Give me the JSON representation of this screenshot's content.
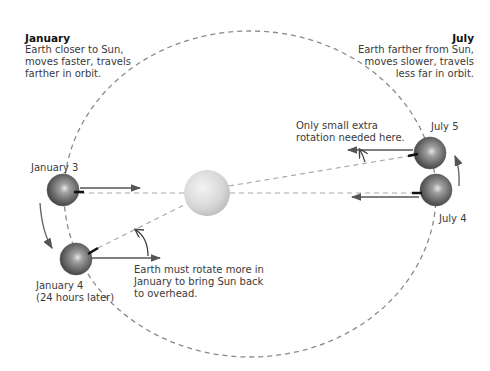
{
  "january_note": {
    "title": "January",
    "lines": [
      "Earth closer to Sun,",
      "moves faster, travels",
      "farther in orbit."
    ]
  },
  "july_note": {
    "title": "July",
    "lines": [
      "Earth farther from Sun,",
      "moves slower, travels",
      "less far in orbit."
    ]
  },
  "positions": {
    "jan3": "January 3",
    "jan4_line1": "January 4",
    "jan4_line2": "(24 hours later)",
    "jul5": "July 5",
    "jul4": "July 4"
  },
  "callouts": {
    "january": [
      "Earth must rotate more in",
      "January to bring Sun back",
      "to overhead."
    ],
    "july": [
      "Only small extra",
      "rotation needed here."
    ]
  },
  "colors": {
    "orbit": "#888888",
    "sun": "#d8d8d8",
    "earth": "#6b6b6b",
    "arrow": "#555555",
    "text": "#3a3a3a"
  }
}
